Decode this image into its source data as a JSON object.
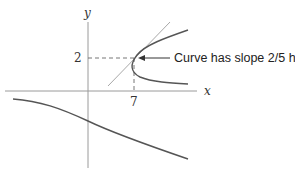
{
  "diagram": {
    "axes": {
      "x_label": "x",
      "y_label": "y"
    },
    "ticks": {
      "y_tick": "2",
      "x_tick": "7"
    },
    "annotation": {
      "text": "Curve has slope 2/5 here"
    },
    "colors": {
      "axis": "#9a9a9a",
      "curve": "#555555",
      "tangent": "#a0a0a0",
      "dashed": "#666666"
    },
    "point": {
      "x": 7,
      "y": 2,
      "slope": "2/5"
    }
  }
}
